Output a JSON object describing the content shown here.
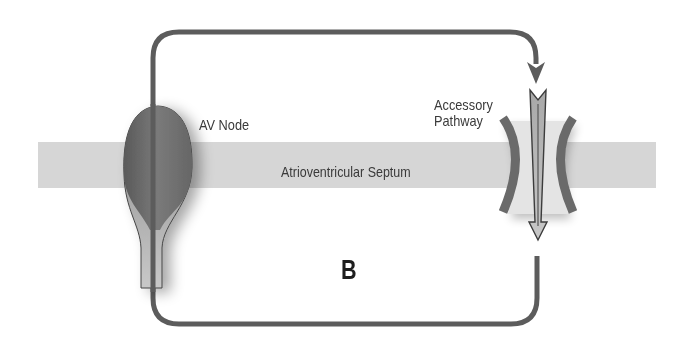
{
  "diagram": {
    "panel_letter": "B",
    "labels": {
      "av_node": "AV Node",
      "septum": "Atrioventricular Septum",
      "accessory_line1": "Accessory",
      "accessory_line2": "Pathway"
    },
    "colors": {
      "septum": "#d6d6d6",
      "loop_stroke": "#5c5c5c",
      "av_node_fill": "#6e6e6e",
      "av_node_stem": "#b7b7b7",
      "arrow_fill": "#b5b5b5",
      "bracket": "#6a6a6a",
      "text": "#3a3a3a"
    }
  }
}
